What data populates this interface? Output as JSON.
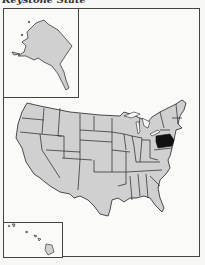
{
  "title": "Keystone State",
  "map": {
    "type": "US states locator map",
    "highlighted_state": "Pennsylvania",
    "insets": [
      "Alaska",
      "Hawaii"
    ],
    "colors": {
      "state_fill": "#d0d0d0",
      "highlight_fill": "#111111",
      "border": "#222222",
      "background": "#fafaf8"
    }
  }
}
